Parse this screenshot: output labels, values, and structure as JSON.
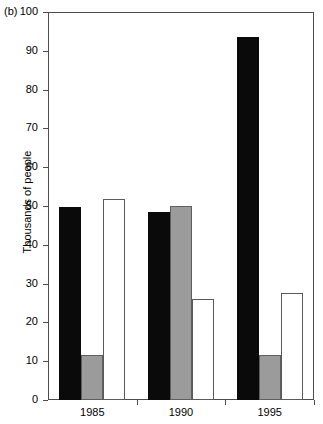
{
  "panel": {
    "label": "(b)"
  },
  "chart_data": {
    "type": "bar",
    "title": "",
    "subtitle": "",
    "xlabel": "",
    "ylabel": "Thousands of people",
    "categories": [
      "1985",
      "1990",
      "1995"
    ],
    "ylim": [
      0,
      100
    ],
    "yticks": [
      0,
      10,
      20,
      30,
      40,
      50,
      60,
      70,
      80,
      90,
      100
    ],
    "ytick_labels": [
      "0",
      "10",
      "20",
      "30",
      "40",
      "50",
      "60",
      "70",
      "80",
      "90",
      "100"
    ],
    "grid": false,
    "legend": "none",
    "series": [
      {
        "name": "series-1",
        "style": "filled-black",
        "color": "#0a0a0a",
        "values": [
          49.7,
          48.4,
          93.5
        ]
      },
      {
        "name": "series-2",
        "style": "filled-gray",
        "color": "#9b9b9b",
        "values": [
          11.6,
          49.9,
          11.7
        ]
      },
      {
        "name": "series-3",
        "style": "open-white",
        "color": "#ffffff",
        "values": [
          51.9,
          26.0,
          27.7
        ]
      }
    ],
    "annotations": [
      "(b)"
    ]
  }
}
